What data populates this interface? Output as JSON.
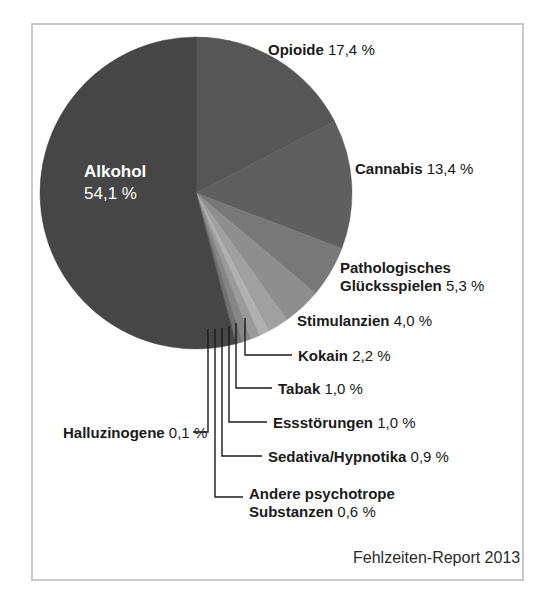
{
  "figure": {
    "credit": "Fehlzeiten-Report 2013",
    "frame_color": "#c9c9c9",
    "background": "#ffffff"
  },
  "chart_data": {
    "type": "pie",
    "title": "",
    "subtitle": "",
    "xlabel": "",
    "ylabel": "",
    "units": "%",
    "legend_position": "callout-labels",
    "grid": false,
    "start_angle_deg": 0,
    "direction": "clockwise",
    "categories": [
      "Alkohol",
      "Opioide",
      "Cannabis",
      "Pathologisches Glücksspielen",
      "Stimulanzien",
      "Kokain",
      "Tabak",
      "Essstörungen",
      "Sedativa/Hypnotika",
      "Andere psychotrope Substanzen",
      "Halluzinogene"
    ],
    "values": [
      54.1,
      17.4,
      13.4,
      5.3,
      4.0,
      2.2,
      1.0,
      1.0,
      0.9,
      0.6,
      0.1
    ],
    "value_labels": [
      "54,1 %",
      "17,4 %",
      "13,4 %",
      "5,3 %",
      "4,0 %",
      "2,2 %",
      "1,0 %",
      "1,0 %",
      "0,9 %",
      "0,6 %",
      "0,1 %"
    ],
    "colors": [
      "#464646",
      "#565656",
      "#5f5f5f",
      "#787878",
      "#8e8e8e",
      "#a0a0a0",
      "#b0b0b0",
      "#9a9a9a",
      "#868686",
      "#727272",
      "#606060"
    ]
  },
  "slices": {
    "alkohol": {
      "name": "Alkohol",
      "value": "54,1 %"
    },
    "opioide": {
      "name": "Opioide",
      "value": "17,4 %"
    },
    "cannabis": {
      "name": "Cannabis",
      "value": "13,4 %"
    },
    "gambling": {
      "name_line1": "Pathologisches",
      "name_line2": "Glücksspielen",
      "value": "5,3 %"
    },
    "stimulanzien": {
      "name": "Stimulanzien",
      "value": "4,0 %"
    },
    "kokain": {
      "name": "Kokain",
      "value": "2,2 %"
    },
    "tabak": {
      "name": "Tabak",
      "value": "1,0 %"
    },
    "essstoerungen": {
      "name": "Essstörungen",
      "value": "1,0 %"
    },
    "halluzinogene": {
      "name": "Halluzinogene",
      "value": "0,1 %"
    },
    "sedativa": {
      "name": "Sedativa/Hypnotika",
      "value": "0,9 %"
    },
    "andere": {
      "name_line1": "Andere psychotrope",
      "name_line2": "Substanzen",
      "value": "0,6 %"
    }
  }
}
